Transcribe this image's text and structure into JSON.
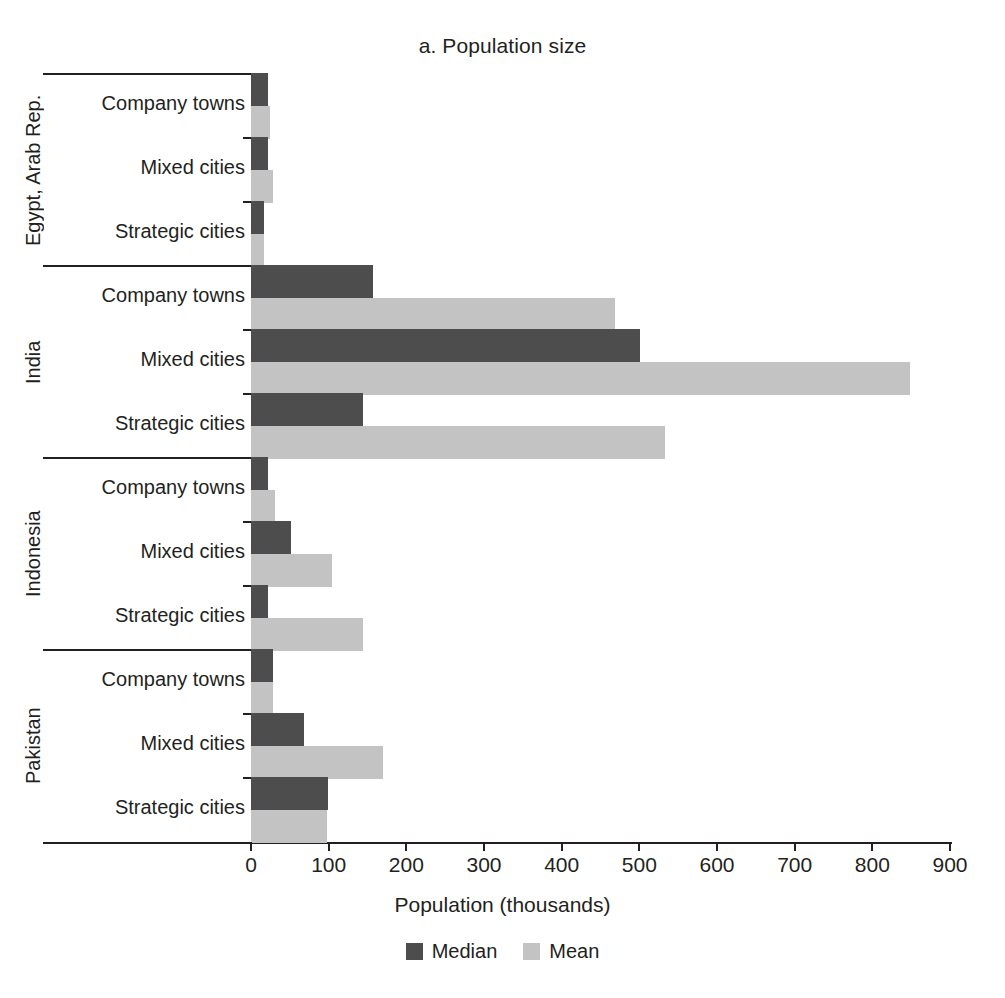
{
  "chart_data": {
    "type": "bar",
    "orientation": "horizontal",
    "title": "a. Population size",
    "xlabel": "Population (thousands)",
    "ylabel": "",
    "xlim": [
      0,
      900
    ],
    "xticks": [
      0,
      100,
      200,
      300,
      400,
      500,
      600,
      700,
      800,
      900
    ],
    "grid": false,
    "legend_position": "bottom",
    "series": [
      {
        "name": "Median",
        "color": "#4d4d4d"
      },
      {
        "name": "Mean",
        "color": "#c3c3c3"
      }
    ],
    "groups": [
      {
        "country": "Egypt, Arab Rep.",
        "categories": [
          {
            "label": "Company towns",
            "median": 22,
            "mean": 24
          },
          {
            "label": "Mixed cities",
            "median": 22,
            "mean": 28
          },
          {
            "label": "Strategic cities",
            "median": 17,
            "mean": 17
          }
        ]
      },
      {
        "country": "India",
        "categories": [
          {
            "label": "Company towns",
            "median": 157,
            "mean": 469
          },
          {
            "label": "Mixed cities",
            "median": 501,
            "mean": 848
          },
          {
            "label": "Strategic cities",
            "median": 144,
            "mean": 533
          }
        ]
      },
      {
        "country": "Indonesia",
        "categories": [
          {
            "label": "Company towns",
            "median": 22,
            "mean": 31
          },
          {
            "label": "Mixed cities",
            "median": 52,
            "mean": 104
          },
          {
            "label": "Strategic cities",
            "median": 22,
            "mean": 144
          }
        ]
      },
      {
        "country": "Pakistan",
        "categories": [
          {
            "label": "Company towns",
            "median": 28,
            "mean": 28
          },
          {
            "label": "Mixed cities",
            "median": 68,
            "mean": 170
          },
          {
            "label": "Strategic cities",
            "median": 99,
            "mean": 98
          }
        ]
      }
    ]
  },
  "colors": {
    "median": "#4d4d4d",
    "mean": "#c3c3c3",
    "axis": "#231f20",
    "background": "#ffffff"
  }
}
